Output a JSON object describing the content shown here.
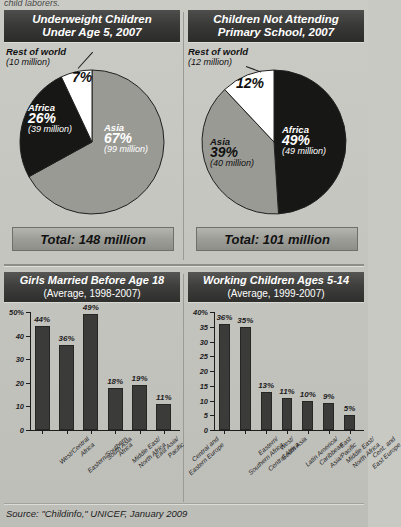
{
  "top_caption": "child laborers.",
  "source": "Source:  \"Childinfo,\"  UNICEF,  January 2009",
  "panels": {
    "pie_left": {
      "title_line1": "Underweight Children",
      "title_line2": "Under Age 5, 2007",
      "total": "Total: 148 million",
      "rest_label_line1": "Rest of world",
      "rest_label_line2": "(10 million)"
    },
    "pie_right": {
      "title_line1": "Children Not Attending",
      "title_line2": "Primary School, 2007",
      "total": "Total: 101 million",
      "rest_label_line1": "Rest of world",
      "rest_label_line2": "(12 million)"
    },
    "bar_left": {
      "title_line1": "Girls Married Before Age 18",
      "title_line2": "(Average, 1998-2007)"
    },
    "bar_right": {
      "title_line1": "Working Children Ages 5-14",
      "title_line2": "(Average, 1999-2007)"
    }
  },
  "chart_data": [
    {
      "type": "pie",
      "title": "Underweight Children Under Age 5, 2007",
      "total_label": "Total: 148 million",
      "legend_position": "in-slice",
      "slices": [
        {
          "name": "Asia",
          "percent": 67,
          "value_label": "(99 million)",
          "pct_label": "67%",
          "color": "#9a9a95"
        },
        {
          "name": "Africa",
          "percent": 26,
          "value_label": "(39 million)",
          "pct_label": "26%",
          "color": "#171715"
        },
        {
          "name": "Rest of world",
          "percent": 7,
          "value_label": "(10 million)",
          "pct_label": "7%",
          "color": "#ffffff"
        }
      ]
    },
    {
      "type": "pie",
      "title": "Children Not Attending Primary School, 2007",
      "total_label": "Total: 101 million",
      "legend_position": "in-slice",
      "slices": [
        {
          "name": "Africa",
          "percent": 49,
          "value_label": "(49 million)",
          "pct_label": "49%",
          "color": "#171715"
        },
        {
          "name": "Asia",
          "percent": 39,
          "value_label": "(40 million)",
          "pct_label": "39%",
          "color": "#9a9a95"
        },
        {
          "name": "Rest of world",
          "percent": 12,
          "value_label": "(12 million)",
          "pct_label": "12%",
          "color": "#ffffff"
        }
      ]
    },
    {
      "type": "bar",
      "title": "Girls Married Before Age 18",
      "subtitle": "(Average, 1998-2007)",
      "xlabel": "",
      "ylabel": "",
      "ylim": [
        0,
        50
      ],
      "grid": false,
      "ytick_labels": [
        "50%",
        "40",
        "30",
        "20",
        "10",
        "0"
      ],
      "ytick_values": [
        50,
        40,
        30,
        20,
        10,
        0
      ],
      "categories": [
        "West/Central\nAfrica",
        "Eastern/Southern\nAfrica",
        "South Asia",
        "Middle East/\nNorth Africa",
        "East Asia/\nPacific",
        "Central and\nEastern Europe"
      ],
      "values": [
        44,
        36,
        49,
        18,
        19,
        11
      ],
      "data_labels": [
        "44%",
        "36%",
        "49%",
        "18%",
        "19%",
        "11%"
      ]
    },
    {
      "type": "bar",
      "title": "Working Children Ages 5-14",
      "subtitle": "(Average, 1999-2007)",
      "xlabel": "",
      "ylabel": "",
      "ylim": [
        0,
        40
      ],
      "grid": false,
      "ytick_labels": [
        "40%",
        "35",
        "30",
        "25",
        "20",
        "15",
        "10",
        "5",
        "0"
      ],
      "ytick_values": [
        40,
        35,
        30,
        25,
        20,
        15,
        10,
        5,
        0
      ],
      "categories": [
        "Eastern/\nSouthern Africa",
        "West/\nCentral Africa",
        "South Asia",
        "Latin America/\nCaribbean",
        "East\nAsia/Pacific",
        "Middle East/\nNorth Africa",
        "Cent. and\nEast Europe"
      ],
      "values": [
        36,
        35,
        13,
        11,
        10,
        9,
        5
      ],
      "data_labels": [
        "36%",
        "35%",
        "13%",
        "11%",
        "10%",
        "9%",
        "5%"
      ]
    }
  ]
}
